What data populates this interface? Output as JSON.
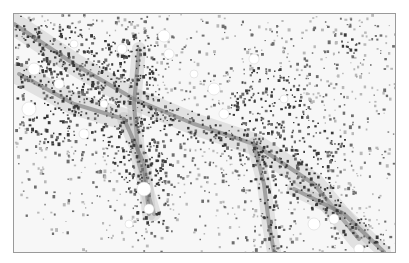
{
  "image": {
    "description": "Grayscale histology micrograph of tissue showing densely stained cells along crossing vessel-like strands with scattered cells and clear vacuoles",
    "palette": {
      "background": "#f7f7f7",
      "dark_stain": "#3a3a3a",
      "mid_stain": "#6e6e6e",
      "light_stain": "#b8b8b8",
      "border": "#9a9a9a"
    }
  }
}
